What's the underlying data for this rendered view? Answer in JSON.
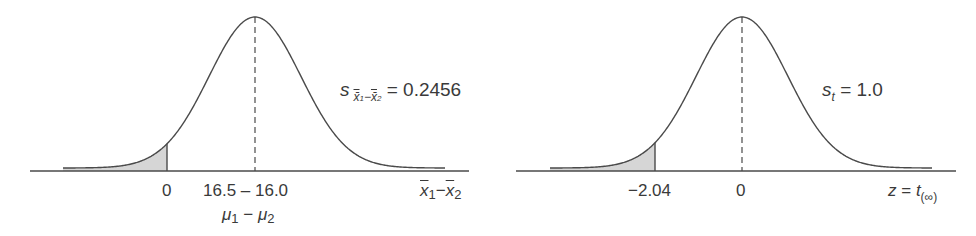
{
  "chart_data": [
    {
      "type": "area",
      "title": "Sampling distribution of difference of means",
      "distribution": "normal",
      "mean_label": "16.5 − 16.0",
      "mean_sublabel": "μ1 − μ2",
      "mean": 0.5,
      "sd_label": "s x̄1−x̄2 = 0.2456",
      "sd": 0.2456,
      "shaded_tail": "left",
      "shaded_boundary": 0,
      "tick_labels": [
        "0",
        "16.5 − 16.0"
      ],
      "xlabel": "x̄1 − x̄2",
      "ylabel": "",
      "grid": false,
      "legend": "none"
    },
    {
      "type": "area",
      "title": "Standard normal distribution",
      "distribution": "normal",
      "mean": 0,
      "sd_label": "s_t = 1.0",
      "sd": 1.0,
      "shaded_tail": "left",
      "shaded_boundary": -2.04,
      "tick_labels": [
        "−2.04",
        "0"
      ],
      "xlabel": "z = t(∞)",
      "ylabel": "",
      "grid": false,
      "legend": "none"
    }
  ],
  "left": {
    "sd_symbol": "s",
    "sd_sub_x1": "x̄",
    "sd_sub_i1": "1",
    "sd_sub_minus": "−",
    "sd_sub_x2": "x̄",
    "sd_sub_i2": "2",
    "sd_value": "= 0.2456",
    "tick_zero": "0",
    "tick_mean": "16.5 – 16.0",
    "mu_label_a": "μ",
    "mu_sub_a": "1",
    "mu_minus": " − ",
    "mu_label_b": "μ",
    "mu_sub_b": "2",
    "axis_x1": "x",
    "axis_i1": "1",
    "axis_minus": "−",
    "axis_x2": "x",
    "axis_i2": "2"
  },
  "right": {
    "sd_symbol": "s",
    "sd_sub": "t",
    "sd_value": "= 1.0",
    "tick_crit": "−2.04",
    "tick_zero": "0",
    "axis_z": "z",
    "axis_eq": " = ",
    "axis_t": "t",
    "axis_sub": "(∞)"
  },
  "colors": {
    "line": "#4a4a4a",
    "shade": "#d6d6d6",
    "text": "#3a3a3a"
  }
}
